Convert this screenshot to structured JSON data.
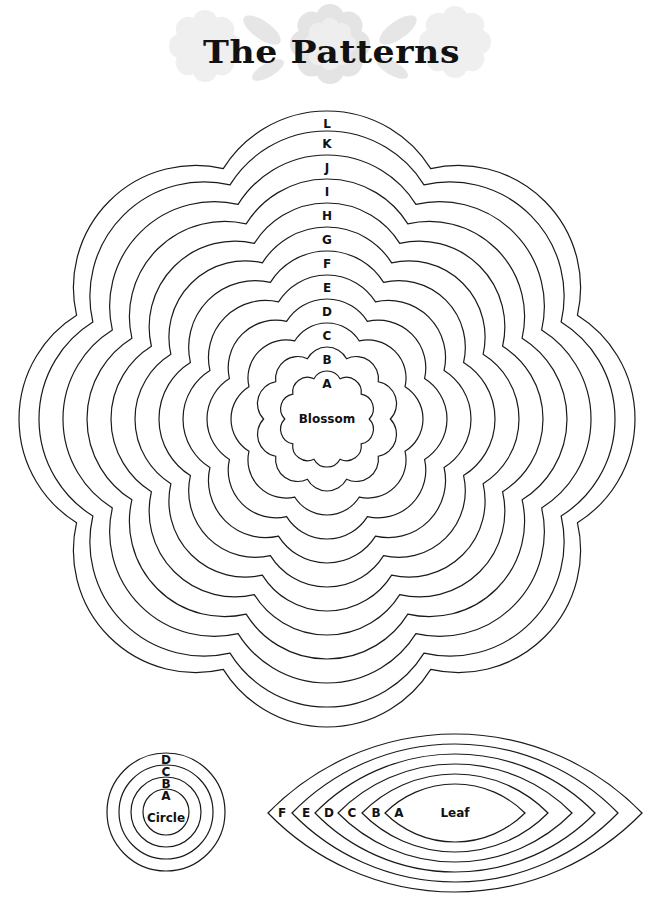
{
  "header": {
    "title": "The Patterns",
    "decoration": "faint-lace-flowers-and-leaves",
    "decoration_color": "#e6e6e6"
  },
  "blossom": {
    "name_label": "Blossom",
    "center": [
      327,
      419
    ],
    "ring_spacing": 24,
    "valley_ratio": 0.88,
    "rings": [
      {
        "label": "A",
        "radius": 48,
        "petals": 10
      },
      {
        "label": "B",
        "radius": 72,
        "petals": 10
      },
      {
        "label": "C",
        "radius": 96,
        "petals": 8
      },
      {
        "label": "D",
        "radius": 120,
        "petals": 8
      },
      {
        "label": "E",
        "radius": 144,
        "petals": 8
      },
      {
        "label": "F",
        "radius": 168,
        "petals": 8
      },
      {
        "label": "G",
        "radius": 192,
        "petals": 8
      },
      {
        "label": "H",
        "radius": 216,
        "petals": 8
      },
      {
        "label": "I",
        "radius": 240,
        "petals": 8
      },
      {
        "label": "J",
        "radius": 264,
        "petals": 8
      },
      {
        "label": "K",
        "radius": 288,
        "petals": 8
      },
      {
        "label": "L",
        "radius": 308,
        "petals": 8
      }
    ]
  },
  "circle": {
    "name_label": "Circle",
    "center": [
      166,
      812
    ],
    "rings": [
      {
        "label": "A",
        "radius": 23
      },
      {
        "label": "B",
        "radius": 35
      },
      {
        "label": "C",
        "radius": 47
      },
      {
        "label": "D",
        "radius": 59
      }
    ]
  },
  "leaf": {
    "name_label": "Leaf",
    "center": [
      455,
      813
    ],
    "rings": [
      {
        "label": "A",
        "half_width": 70,
        "half_height": 29
      },
      {
        "label": "B",
        "half_width": 93,
        "half_height": 39
      },
      {
        "label": "C",
        "half_width": 117,
        "half_height": 49
      },
      {
        "label": "D",
        "half_width": 140,
        "half_height": 59
      },
      {
        "label": "E",
        "half_width": 163,
        "half_height": 69
      },
      {
        "label": "F",
        "half_width": 187,
        "half_height": 79
      }
    ]
  },
  "style": {
    "stroke_color": "#1a1a1a",
    "stroke_width": 1.2,
    "background": "#ffffff"
  }
}
